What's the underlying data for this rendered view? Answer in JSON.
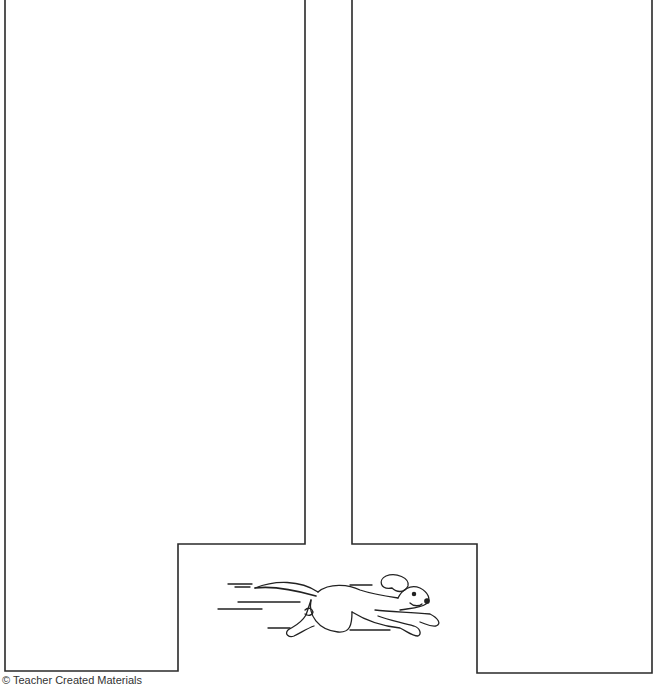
{
  "worksheet": {
    "shape": "maze-path-outline",
    "stroke_color": "#2a2a2a",
    "background_color": "#ffffff",
    "illustration": "running-dog-icon"
  },
  "footer": {
    "copyright": "© Teacher Created Materials"
  }
}
